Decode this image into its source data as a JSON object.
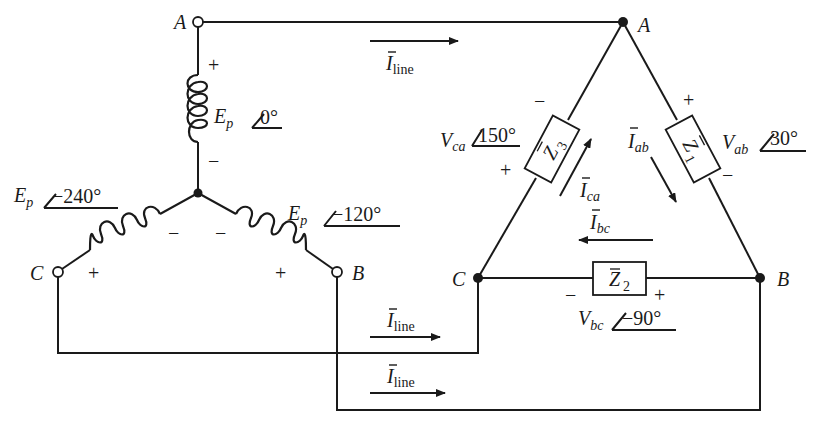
{
  "source": {
    "nodes": {
      "A": "A",
      "B": "B",
      "C": "C"
    },
    "phases": [
      {
        "name": "E",
        "sub": "p",
        "angle": "0°",
        "plus": "+",
        "minus": "−"
      },
      {
        "name": "E",
        "sub": "p",
        "angle": "−120°",
        "plus": "+",
        "minus": "−"
      },
      {
        "name": "E",
        "sub": "p",
        "angle": "−240°",
        "plus": "+",
        "minus": "−"
      }
    ]
  },
  "load": {
    "nodes": {
      "A": "A",
      "B": "B",
      "C": "C"
    },
    "impedances": [
      {
        "name": "Z",
        "sub": "1"
      },
      {
        "name": "Z",
        "sub": "2"
      },
      {
        "name": "Z",
        "sub": "3"
      }
    ],
    "voltages": [
      {
        "name": "V",
        "sub": "ab",
        "angle": "30°",
        "plus": "+",
        "minus": "−"
      },
      {
        "name": "V",
        "sub": "bc",
        "angle": "−90°",
        "plus": "+",
        "minus": "−"
      },
      {
        "name": "V",
        "sub": "ca",
        "angle": "150°",
        "plus": "+",
        "minus": "−"
      }
    ],
    "currents": [
      {
        "name": "I",
        "sub": "ab"
      },
      {
        "name": "I",
        "sub": "bc"
      },
      {
        "name": "I",
        "sub": "ca"
      }
    ]
  },
  "line_currents": [
    {
      "name": "I",
      "sub": "line"
    },
    {
      "name": "I",
      "sub": "line"
    },
    {
      "name": "I",
      "sub": "line"
    }
  ],
  "colors": {
    "ink": "#1a1a1a",
    "background": "#ffffff"
  }
}
